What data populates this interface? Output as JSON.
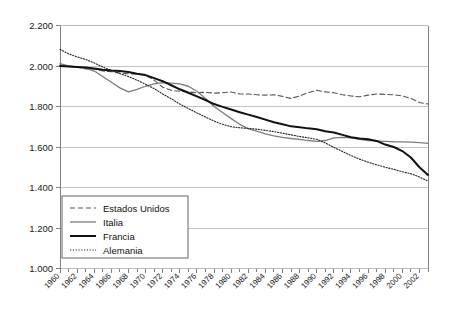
{
  "chart_data": {
    "type": "line",
    "title": "",
    "subtitle": "",
    "xlabel": "",
    "ylabel": "",
    "xlim": [
      1960,
      2003
    ],
    "ylim": [
      1.0,
      2.2
    ],
    "ytick_step": 0.2,
    "xtick_step": 1,
    "xlabel_step": 2,
    "grid": true,
    "grid_axis": "y",
    "legend_position": "bottom-left-inside",
    "ytick_labels": [
      "1.000",
      "1.200",
      "1.400",
      "1.600",
      "1.800",
      "2.000",
      "2.200"
    ],
    "ytick_values": [
      1.0,
      1.2,
      1.4,
      1.6,
      1.8,
      2.0,
      2.2
    ],
    "xtick_labels": [
      "1960",
      "1962",
      "1964",
      "1966",
      "1968",
      "1970",
      "1972",
      "1974",
      "1976",
      "1978",
      "1980",
      "1982",
      "1984",
      "1986",
      "1988",
      "1990",
      "1992",
      "1994",
      "1996",
      "1998",
      "2000",
      "2002"
    ],
    "x": [
      1960,
      1961,
      1962,
      1963,
      1964,
      1965,
      1966,
      1967,
      1968,
      1969,
      1970,
      1971,
      1972,
      1973,
      1974,
      1975,
      1976,
      1977,
      1978,
      1979,
      1980,
      1981,
      1982,
      1983,
      1984,
      1985,
      1986,
      1987,
      1988,
      1989,
      1990,
      1991,
      1992,
      1993,
      1994,
      1995,
      1996,
      1997,
      1998,
      1999,
      2000,
      2001,
      2002,
      2003
    ],
    "series": [
      {
        "name": "Estados Unidos",
        "style": "dashed",
        "color": "#555555",
        "width": 1.1,
        "values": [
          2.005,
          2.0,
          1.995,
          1.985,
          1.985,
          1.975,
          1.972,
          1.965,
          1.962,
          1.96,
          1.955,
          1.93,
          1.895,
          1.88,
          1.875,
          1.872,
          1.868,
          1.87,
          1.866,
          1.868,
          1.872,
          1.862,
          1.862,
          1.858,
          1.856,
          1.858,
          1.85,
          1.84,
          1.852,
          1.868,
          1.88,
          1.872,
          1.868,
          1.858,
          1.852,
          1.848,
          1.856,
          1.862,
          1.86,
          1.858,
          1.852,
          1.84,
          1.82,
          1.812
        ]
      },
      {
        "name": "Italia",
        "style": "solid-thin",
        "color": "#7d7d7d",
        "width": 1.3,
        "values": [
          2.012,
          2.0,
          1.995,
          1.99,
          1.975,
          1.948,
          1.92,
          1.892,
          1.872,
          1.885,
          1.9,
          1.912,
          1.918,
          1.915,
          1.912,
          1.9,
          1.875,
          1.84,
          1.8,
          1.77,
          1.74,
          1.712,
          1.69,
          1.678,
          1.665,
          1.655,
          1.648,
          1.642,
          1.638,
          1.632,
          1.628,
          1.632,
          1.645,
          1.648,
          1.645,
          1.638,
          1.632,
          1.63,
          1.628,
          1.626,
          1.625,
          1.624,
          1.622,
          1.618
        ]
      },
      {
        "name": "Francia",
        "style": "solid-thick",
        "color": "#111111",
        "width": 2.0,
        "values": [
          2.0,
          1.998,
          1.995,
          1.992,
          1.988,
          1.982,
          1.978,
          1.975,
          1.97,
          1.962,
          1.955,
          1.94,
          1.925,
          1.905,
          1.885,
          1.868,
          1.85,
          1.832,
          1.812,
          1.798,
          1.785,
          1.772,
          1.76,
          1.748,
          1.735,
          1.722,
          1.712,
          1.702,
          1.698,
          1.692,
          1.688,
          1.678,
          1.672,
          1.66,
          1.648,
          1.642,
          1.638,
          1.63,
          1.612,
          1.6,
          1.58,
          1.548,
          1.5,
          1.462
        ]
      },
      {
        "name": "Alemania",
        "style": "dotted",
        "color": "#222222",
        "width": 1.1,
        "values": [
          2.082,
          2.06,
          2.045,
          2.032,
          2.015,
          1.995,
          1.978,
          1.962,
          1.948,
          1.93,
          1.91,
          1.888,
          1.862,
          1.838,
          1.812,
          1.79,
          1.768,
          1.748,
          1.728,
          1.712,
          1.7,
          1.695,
          1.692,
          1.688,
          1.682,
          1.676,
          1.668,
          1.66,
          1.652,
          1.645,
          1.638,
          1.62,
          1.598,
          1.578,
          1.558,
          1.54,
          1.525,
          1.512,
          1.5,
          1.49,
          1.478,
          1.468,
          1.452,
          1.432
        ]
      }
    ]
  },
  "legend": {
    "items": [
      {
        "label": "Estados Unidos",
        "style": "dashed"
      },
      {
        "label": "Italia",
        "style": "solid-thin"
      },
      {
        "label": "Francia",
        "style": "solid-thick"
      },
      {
        "label": "Alemania",
        "style": "dotted"
      }
    ]
  },
  "colors": {
    "background": "#ffffff",
    "axis": "#808080",
    "grid": "#b5b5b5",
    "text": "#1a1a1a"
  }
}
